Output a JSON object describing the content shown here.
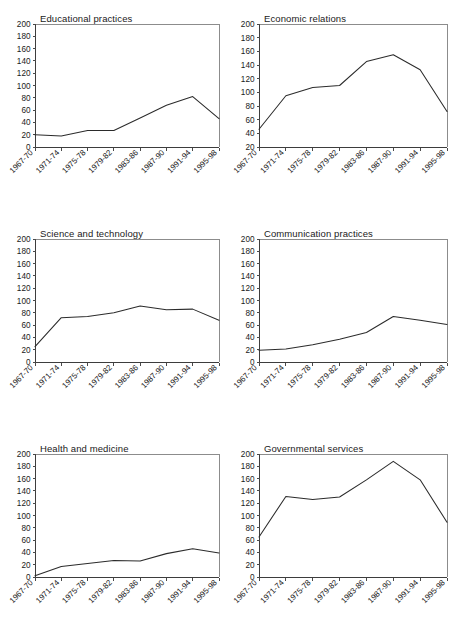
{
  "figure": {
    "background": "#ffffff",
    "line_color": "#2b2b2b",
    "axis_color": "#3d3d3d",
    "frame_color": "#8c8c8c",
    "layout": {
      "rows": 3,
      "cols": 2,
      "panel_order": [
        "educational-practices",
        "economic-relations",
        "science-and-technology",
        "communication-practices",
        "health-and-medicine",
        "governmental-services"
      ]
    }
  },
  "chart_data": [
    {
      "id": "educational-practices",
      "type": "line",
      "title": "Educational practices",
      "xlabel": "",
      "ylabel": "",
      "categories": [
        "1967-70",
        "1971-74",
        "1975-78",
        "1979-82",
        "1983-86",
        "1987-90",
        "1991-94",
        "1995-98"
      ],
      "values": [
        20,
        18,
        27,
        27,
        47,
        68,
        82,
        46
      ],
      "ylim": [
        0,
        200
      ],
      "ytick_step": 20,
      "yticks": [
        0,
        20,
        40,
        60,
        80,
        100,
        120,
        140,
        160,
        180,
        200
      ],
      "grid": false,
      "legend": "none"
    },
    {
      "id": "economic-relations",
      "type": "line",
      "title": "Economic relations",
      "xlabel": "",
      "ylabel": "",
      "categories": [
        "1967-70",
        "1971-74",
        "1975-78",
        "1979-82",
        "1983-86",
        "1987-90",
        "1991-94",
        "1995-98"
      ],
      "values": [
        46,
        95,
        107,
        110,
        145,
        155,
        133,
        72
      ],
      "ylim": [
        20,
        200
      ],
      "ytick_step": 20,
      "yticks": [
        20,
        40,
        60,
        80,
        100,
        120,
        140,
        160,
        180,
        200
      ],
      "grid": false,
      "legend": "none"
    },
    {
      "id": "science-and-technology",
      "type": "line",
      "title": "Science and technology",
      "xlabel": "",
      "ylabel": "",
      "categories": [
        "1967-70",
        "1971-74",
        "1975-78",
        "1979-82",
        "1983-86",
        "1987-90",
        "1991-94",
        "1995-98"
      ],
      "values": [
        25,
        72,
        74,
        80,
        91,
        85,
        86,
        68
      ],
      "ylim": [
        0,
        200
      ],
      "ytick_step": 20,
      "yticks": [
        0,
        20,
        40,
        60,
        80,
        100,
        120,
        140,
        160,
        180,
        200
      ],
      "grid": false,
      "legend": "none"
    },
    {
      "id": "communication-practices",
      "type": "line",
      "title": "Communication practices",
      "xlabel": "",
      "ylabel": "",
      "categories": [
        "1967-70",
        "1971-74",
        "1975-78",
        "1979-82",
        "1983-86",
        "1987-90",
        "1991-94",
        "1995-98"
      ],
      "values": [
        19,
        21,
        28,
        37,
        48,
        74,
        68,
        61
      ],
      "ylim": [
        0,
        200
      ],
      "ytick_step": 20,
      "yticks": [
        0,
        20,
        40,
        60,
        80,
        100,
        120,
        140,
        160,
        180,
        200
      ],
      "grid": false,
      "legend": "none"
    },
    {
      "id": "health-and-medicine",
      "type": "line",
      "title": "Health and medicine",
      "xlabel": "",
      "ylabel": "",
      "categories": [
        "1967-70",
        "1971-74",
        "1975-78",
        "1979-82",
        "1983-86",
        "1987-90",
        "1991-94",
        "1995-98"
      ],
      "values": [
        2,
        17,
        22,
        27,
        26,
        38,
        46,
        39
      ],
      "ylim": [
        0,
        200
      ],
      "ytick_step": 20,
      "yticks": [
        0,
        20,
        40,
        60,
        80,
        100,
        120,
        140,
        160,
        180,
        200
      ],
      "grid": false,
      "legend": "none"
    },
    {
      "id": "governmental-services",
      "type": "line",
      "title": "Governmental services",
      "xlabel": "",
      "ylabel": "",
      "categories": [
        "1967-70",
        "1971-74",
        "1975-78",
        "1979-82",
        "1983-86",
        "1987-90",
        "1991-94",
        "1995-98"
      ],
      "values": [
        65,
        131,
        126,
        130,
        158,
        188,
        158,
        89
      ],
      "ylim": [
        0,
        200
      ],
      "ytick_step": 20,
      "yticks": [
        0,
        20,
        40,
        60,
        80,
        100,
        120,
        140,
        160,
        180,
        200
      ],
      "grid": false,
      "legend": "none"
    }
  ]
}
